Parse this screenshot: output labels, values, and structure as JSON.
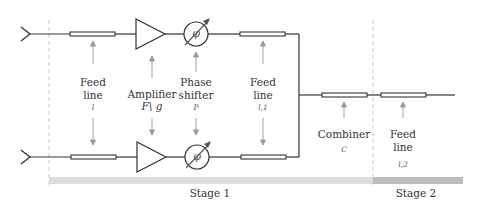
{
  "diagram": {
    "colors": {
      "wire": "#333333",
      "arrow": "#999999",
      "divider": "#c8c8c8",
      "stage1_bar": "#dcdcdc",
      "stage2_bar": "#bdbdbd",
      "feedline_fill": "#ffffff"
    },
    "components": {
      "feed_line_1": {
        "title_line1": "Feed",
        "title_line2": "line",
        "symbol": "l"
      },
      "amplifier": {
        "title_line1": "Amplifier",
        "symbol": "F\\ g"
      },
      "phase_shifter": {
        "title_line1": "Phase",
        "title_line2": "shifter",
        "symbol": "P",
        "glyph": "φ"
      },
      "feed_line_2": {
        "title_line1": "Feed",
        "title_line2": "line",
        "symbol": "l,1"
      },
      "combiner": {
        "title_line1": "Combiner",
        "symbol": "C"
      },
      "feed_line_3": {
        "title_line1": "Feed",
        "title_line2": "line",
        "symbol": "l,2"
      }
    },
    "stages": [
      {
        "label": "Stage 1"
      },
      {
        "label": "Stage 2"
      }
    ],
    "icons": {
      "antenna_top": "antenna-icon",
      "antenna_bottom": "antenna-icon",
      "phase_glyph_top": "φ",
      "phase_glyph_bottom": "φ"
    }
  }
}
